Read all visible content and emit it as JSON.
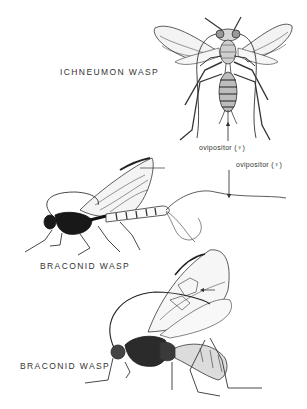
{
  "figure": {
    "specimens": [
      {
        "id": "ichneumon",
        "label": "ICHNEUMON WASP",
        "view": "dorsal",
        "annotation": "ovipositor (♀)"
      },
      {
        "id": "braconid-1",
        "label": "BRACONID WASP",
        "view": "lateral",
        "annotation": "ovipositor (♀)"
      },
      {
        "id": "braconid-2",
        "label": "BRACONID WASP",
        "view": "lateral"
      }
    ]
  }
}
